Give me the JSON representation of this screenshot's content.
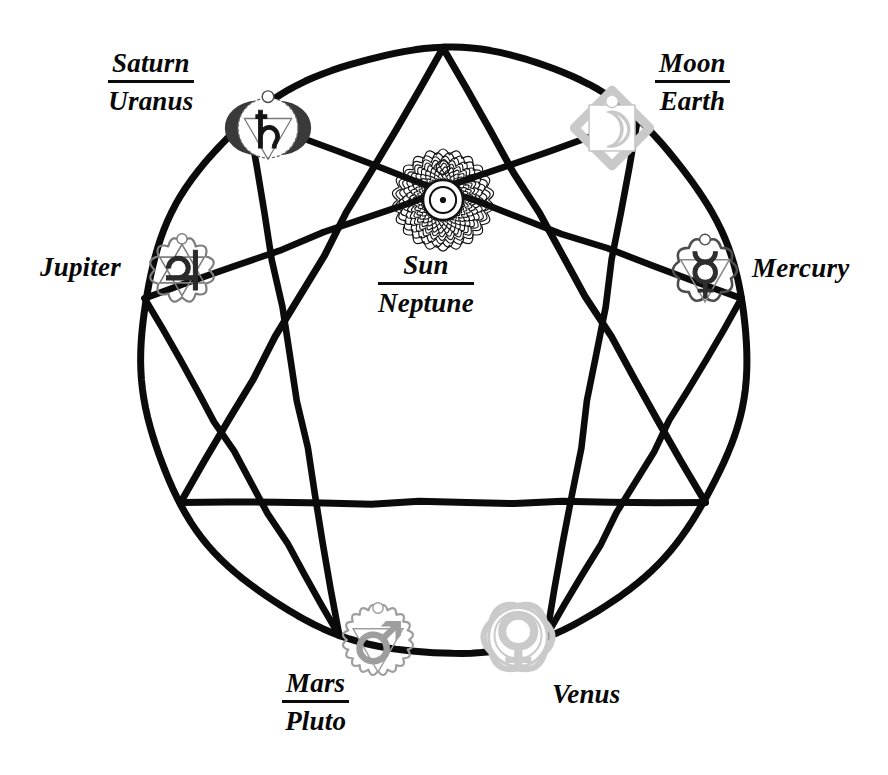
{
  "figure": {
    "type": "enneagram-diagram",
    "background_color": "#ffffff",
    "line_color": "#0b0b0b"
  },
  "geometry": {
    "center": {
      "x": 443,
      "y": 351
    },
    "radius": 303,
    "point_count": 9,
    "triangle_points": [
      9,
      3,
      6
    ],
    "hexad_sequence": [
      1,
      4,
      2,
      8,
      5,
      7,
      1
    ]
  },
  "labels": {
    "saturn": {
      "numerator": "Saturn",
      "denominator": "Uranus",
      "style": "stacked"
    },
    "moon": {
      "numerator": "Moon",
      "denominator": "Earth",
      "style": "stacked"
    },
    "jupiter": {
      "text": "Jupiter",
      "style": "single"
    },
    "mercury": {
      "text": "Mercury",
      "style": "single"
    },
    "sun": {
      "numerator": "Sun",
      "denominator": "Neptune",
      "style": "stacked"
    },
    "mars": {
      "numerator": "Mars",
      "denominator": "Pluto",
      "style": "stacked"
    },
    "venus": {
      "text": "Venus",
      "style": "single"
    }
  },
  "nodes": [
    {
      "id": "saturn",
      "planet_symbol": "♄",
      "chakra": "ajna",
      "chakra_petals": 2,
      "position": {
        "x": 268,
        "y": 128
      },
      "size": 74,
      "color": "#3a3a3a"
    },
    {
      "id": "moon",
      "planet_symbol": "☽",
      "chakra": "vishuddha",
      "chakra_petals": 16,
      "position": {
        "x": 612,
        "y": 128
      },
      "size": 74,
      "color": "#c9c9c9"
    },
    {
      "id": "jupiter",
      "planet_symbol": "♃",
      "chakra": "anahata",
      "chakra_petals": 12,
      "position": {
        "x": 182,
        "y": 270
      },
      "size": 78,
      "color": "#7d7d7d"
    },
    {
      "id": "mercury",
      "planet_symbol": "☿",
      "chakra": "anahata-upper",
      "chakra_petals": 10,
      "position": {
        "x": 705,
        "y": 270
      },
      "size": 76,
      "color": "#4d4d4d"
    },
    {
      "id": "sun",
      "planet_symbol": "☉",
      "chakra": "sahasrara",
      "chakra_petals": 40,
      "position": {
        "x": 443,
        "y": 200
      },
      "size": 114,
      "color": "#1a1a1a"
    },
    {
      "id": "mars",
      "planet_symbol": "♂",
      "chakra": "manipura",
      "chakra_petals": 20,
      "position": {
        "x": 378,
        "y": 640
      },
      "size": 80,
      "color": "#9e9e9e"
    },
    {
      "id": "venus",
      "planet_symbol": "♀",
      "chakra": "svadhisthana",
      "chakra_petals": 6,
      "position": {
        "x": 518,
        "y": 637
      },
      "size": 84,
      "color": "#cacaca"
    }
  ],
  "chart_data": {
    "type": "diagram",
    "nodes": [
      {
        "point": 9,
        "label": "Sun / Neptune",
        "planet": "Sun",
        "secondary": "Neptune",
        "symbol": "☉",
        "chakra": "sahasrara (crown)"
      },
      {
        "point": 1,
        "label": "Moon / Earth",
        "planet": "Moon",
        "secondary": "Earth",
        "symbol": "☽",
        "chakra": "vishuddha (throat)"
      },
      {
        "point": 2,
        "label": "Mercury",
        "planet": "Mercury",
        "secondary": "",
        "symbol": "☿",
        "chakra": "anahata"
      },
      {
        "point": 4,
        "label": "Venus",
        "planet": "Venus",
        "secondary": "",
        "symbol": "♀",
        "chakra": "svadhisthana (sacral)"
      },
      {
        "point": 5,
        "label": "Mars / Pluto",
        "planet": "Mars",
        "secondary": "Pluto",
        "symbol": "♂",
        "chakra": "manipura (solar plexus)"
      },
      {
        "point": 7,
        "label": "Jupiter",
        "planet": "Jupiter",
        "secondary": "",
        "symbol": "♃",
        "chakra": "anahata (heart)"
      },
      {
        "point": 8,
        "label": "Saturn / Uranus",
        "planet": "Saturn",
        "secondary": "Uranus",
        "symbol": "♄",
        "chakra": "ajna (third eye)"
      }
    ],
    "edges_triangle": [
      "9-3",
      "3-6",
      "6-9"
    ],
    "edges_hexad": [
      "1-4",
      "4-2",
      "2-8",
      "8-5",
      "5-7",
      "7-1"
    ]
  }
}
